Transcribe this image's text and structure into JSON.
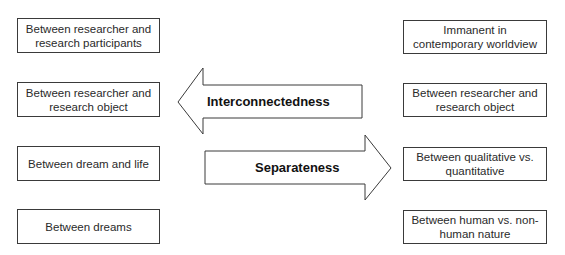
{
  "left_column": {
    "items": [
      {
        "label": "Between researcher and research participants"
      },
      {
        "label": "Between researcher and research object"
      },
      {
        "label": "Between dream and life"
      },
      {
        "label": "Between dreams"
      }
    ]
  },
  "right_column": {
    "items": [
      {
        "label": "Immanent in contemporary worldview"
      },
      {
        "label": "Between researcher and research object"
      },
      {
        "label": "Between qualitative vs. quantitative"
      },
      {
        "label": "Between human vs. non-human nature"
      }
    ]
  },
  "arrows": {
    "left_arrow": {
      "label": "Interconnectedness",
      "direction": "left"
    },
    "right_arrow": {
      "label": "Separateness",
      "direction": "right"
    }
  },
  "colors": {
    "stroke": "#3a3a3a",
    "fill": "#ffffff",
    "text": "#222222"
  }
}
